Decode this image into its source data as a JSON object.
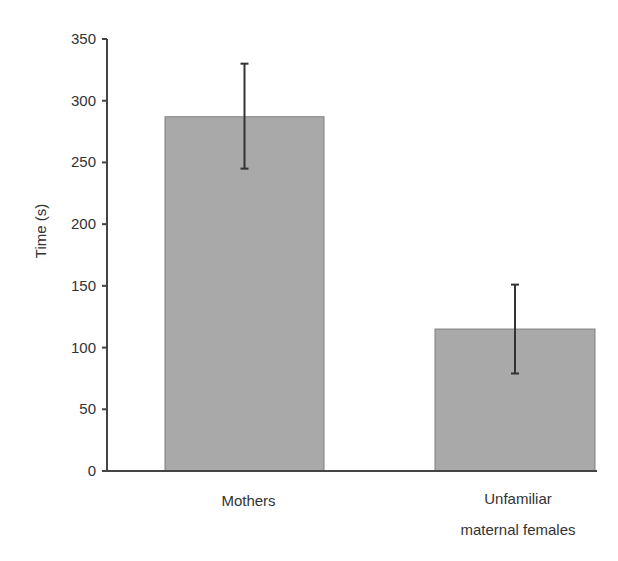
{
  "chart_data": {
    "type": "bar",
    "title": "",
    "xlabel": "",
    "ylabel": "Time (s)",
    "ylim": [
      0,
      350
    ],
    "yticks": [
      0,
      50,
      100,
      150,
      200,
      250,
      300,
      350
    ],
    "grid": false,
    "legend": null,
    "categories": [
      "Mothers",
      "Unfamiliar maternal females"
    ],
    "category_label_lines": [
      [
        "Mothers"
      ],
      [
        "Unfamiliar",
        "maternal females"
      ]
    ],
    "values": [
      287,
      115
    ],
    "error_bars": {
      "upper": [
        330,
        151
      ],
      "lower": [
        245,
        79
      ]
    },
    "bar_color": "#a9a9a9",
    "bar_edge_color": "#7f7f7f",
    "axis_color": "#444444"
  }
}
